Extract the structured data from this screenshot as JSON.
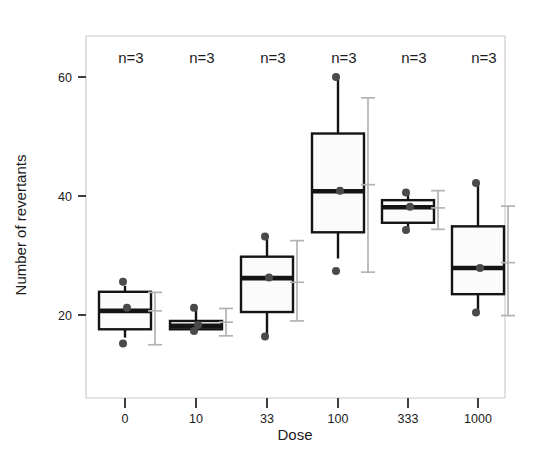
{
  "chart_data": {
    "type": "box",
    "title": "",
    "xlabel": "Dose",
    "ylabel": "Number of revertants",
    "categories": [
      "0",
      "10",
      "33",
      "100",
      "333",
      "1000"
    ],
    "ylim": [
      10,
      64
    ],
    "xtick_labels": [
      "0",
      "10",
      "33",
      "100",
      "333",
      "1000"
    ],
    "ytick_labels": [
      "20",
      "40",
      "60"
    ],
    "ytick_values": [
      20,
      40,
      60
    ],
    "grid": false,
    "legend": "none",
    "annotations": [
      "n=3",
      "n=3",
      "n=3",
      "n=3",
      "n=3",
      "n=3"
    ],
    "series": [
      {
        "name": "Dose 0",
        "category": "0",
        "q1": 17.6,
        "median": 20.7,
        "q3": 23.9,
        "whisker_low": 16.2,
        "whisker_high": 24.9,
        "mean": 20.7,
        "sd_low": 15.0,
        "sd_high": 23.8,
        "points": [
          25.6,
          21.2,
          15.2
        ]
      },
      {
        "name": "Dose 10",
        "category": "10",
        "q1": 17.6,
        "median": 18.2,
        "q3": 19.0,
        "whisker_low": 17.0,
        "whisker_high": 21.2,
        "mean": 18.8,
        "sd_low": 16.5,
        "sd_high": 21.1,
        "points": [
          21.2,
          18.3,
          17.3
        ]
      },
      {
        "name": "Dose 33",
        "category": "33",
        "q1": 20.5,
        "median": 26.2,
        "q3": 29.8,
        "whisker_low": 16.4,
        "whisker_high": 33.2,
        "mean": 25.5,
        "sd_low": 19.0,
        "sd_high": 32.5,
        "points": [
          33.2,
          26.3,
          16.4
        ]
      },
      {
        "name": "Dose 100",
        "category": "100",
        "q1": 33.9,
        "median": 40.8,
        "q3": 50.5,
        "whisker_low": 29.5,
        "whisker_high": 60.0,
        "mean": 41.9,
        "sd_low": 27.2,
        "sd_high": 56.5,
        "points": [
          60.0,
          40.9,
          27.4
        ]
      },
      {
        "name": "Dose 333",
        "category": "333",
        "q1": 35.5,
        "median": 38.1,
        "q3": 39.3,
        "whisker_low": 34.3,
        "whisker_high": 40.6,
        "mean": 38.0,
        "sd_low": 34.4,
        "sd_high": 40.9,
        "points": [
          40.6,
          38.2,
          34.3
        ]
      },
      {
        "name": "Dose 1000",
        "category": "1000",
        "q1": 23.5,
        "median": 27.9,
        "q3": 34.9,
        "whisker_low": 20.4,
        "whisker_high": 42.2,
        "mean": 28.8,
        "sd_low": 19.9,
        "sd_high": 38.3,
        "points": [
          42.2,
          27.9,
          20.4
        ]
      }
    ]
  },
  "colors": {
    "box_stroke": "#141414",
    "box_fill": "#fbfbfb",
    "point": "#4a4a4a",
    "error_bar": "#b3b3b3",
    "frame": "#c9c9c9",
    "text": "#1b1b1b",
    "background": "#ffffff"
  }
}
